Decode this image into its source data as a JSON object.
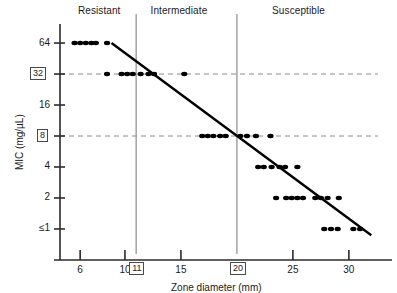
{
  "figure": {
    "background_color": "#ffffff",
    "axis_color": "#2b2b2b",
    "point_color": "#000000",
    "regression_color": "#000000",
    "breakpoint_line_color": "#8c8c8c",
    "gridline_color": "#8c8c8c"
  },
  "headers": {
    "resistant": "Resistant",
    "intermediate": "Intermediate",
    "susceptible": "Susceptible"
  },
  "axes": {
    "x_title": "Zone diameter (mm)",
    "y_title": "MIC (mg/µL)",
    "x_ticks": [
      "6",
      "10",
      "15",
      "25",
      "30"
    ],
    "x_tick_values": [
      6,
      10,
      15,
      25,
      30
    ],
    "y_ticks": [
      "64",
      "32",
      "16",
      "8",
      "4",
      "2",
      "≤1"
    ],
    "y_tick_values": [
      64,
      32,
      16,
      8,
      4,
      2,
      1
    ],
    "x_range": [
      4.2,
      32.6
    ],
    "y_range_log2": [
      -0.55,
      6.55
    ]
  },
  "breakpoints": {
    "x_boxed": [
      "11",
      "20"
    ],
    "x_boxed_values": [
      11,
      20
    ],
    "y_boxed": [
      "32",
      "8"
    ],
    "y_boxed_values": [
      32,
      8
    ]
  },
  "chart_data": {
    "type": "scatter",
    "title": "",
    "xlabel": "Zone diameter (mm)",
    "ylabel": "MIC (mg/µL)",
    "xlim": [
      4.2,
      32.6
    ],
    "ylim": [
      1,
      64
    ],
    "y_scale": "log2",
    "ytick_labels": [
      "≤1",
      "2",
      "4",
      "8",
      "16",
      "32",
      "64"
    ],
    "ytick_values": [
      1,
      2,
      4,
      8,
      16,
      32,
      64
    ],
    "xtick_labels": [
      "6",
      "10",
      "15",
      "25",
      "30"
    ],
    "xtick_values": [
      6,
      10,
      15,
      25,
      30
    ],
    "grid": "horizontal dashed gridlines at MIC 32 and MIC 8 only",
    "legend": "none",
    "annotations": [
      {
        "text": "Resistant",
        "x_center": 8.3,
        "position": "top"
      },
      {
        "text": "Intermediate",
        "x_center": 15.5,
        "position": "top"
      },
      {
        "text": "Susceptible",
        "x_center": 26.0,
        "position": "top"
      },
      {
        "text": "11",
        "type": "vertical-breakpoint",
        "x": 11
      },
      {
        "text": "20",
        "type": "vertical-breakpoint",
        "x": 20
      },
      {
        "text": "32",
        "type": "horizontal-breakpoint",
        "y": 32
      },
      {
        "text": "8",
        "type": "horizontal-breakpoint",
        "y": 8
      }
    ],
    "regression_line": {
      "x_start": 8.8,
      "y_start": 64,
      "x_end": 32.0,
      "y_end": 0.87,
      "description": "Inverse linear regression of log2(MIC) on zone diameter"
    },
    "points": [
      {
        "x": 5.5,
        "y": 64
      },
      {
        "x": 6.0,
        "y": 64
      },
      {
        "x": 6.5,
        "y": 64
      },
      {
        "x": 7.0,
        "y": 64
      },
      {
        "x": 7.4,
        "y": 64
      },
      {
        "x": 8.4,
        "y": 64
      },
      {
        "x": 8.4,
        "y": 32
      },
      {
        "x": 9.7,
        "y": 32
      },
      {
        "x": 10.2,
        "y": 32
      },
      {
        "x": 10.7,
        "y": 32
      },
      {
        "x": 11.4,
        "y": 32
      },
      {
        "x": 12.1,
        "y": 32
      },
      {
        "x": 12.6,
        "y": 32
      },
      {
        "x": 15.3,
        "y": 32
      },
      {
        "x": 16.9,
        "y": 8
      },
      {
        "x": 17.4,
        "y": 8
      },
      {
        "x": 17.9,
        "y": 8
      },
      {
        "x": 18.5,
        "y": 8
      },
      {
        "x": 19.0,
        "y": 8
      },
      {
        "x": 20.3,
        "y": 8
      },
      {
        "x": 20.9,
        "y": 8
      },
      {
        "x": 21.7,
        "y": 8
      },
      {
        "x": 23.0,
        "y": 8
      },
      {
        "x": 21.9,
        "y": 4
      },
      {
        "x": 22.4,
        "y": 4
      },
      {
        "x": 23.1,
        "y": 4
      },
      {
        "x": 23.8,
        "y": 4
      },
      {
        "x": 24.3,
        "y": 4
      },
      {
        "x": 25.4,
        "y": 4
      },
      {
        "x": 23.5,
        "y": 2
      },
      {
        "x": 24.4,
        "y": 2
      },
      {
        "x": 24.9,
        "y": 2
      },
      {
        "x": 25.4,
        "y": 2
      },
      {
        "x": 25.9,
        "y": 2
      },
      {
        "x": 27.0,
        "y": 2
      },
      {
        "x": 27.5,
        "y": 2
      },
      {
        "x": 28.1,
        "y": 2
      },
      {
        "x": 29.1,
        "y": 2
      },
      {
        "x": 27.8,
        "y": 1
      },
      {
        "x": 28.4,
        "y": 1
      },
      {
        "x": 29.0,
        "y": 1
      },
      {
        "x": 30.4,
        "y": 1
      },
      {
        "x": 31.0,
        "y": 1
      }
    ]
  }
}
